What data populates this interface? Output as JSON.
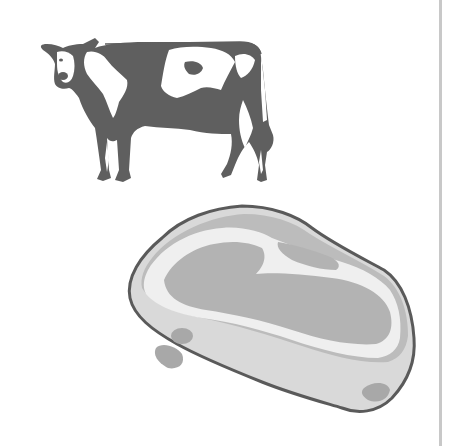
{
  "illustration": {
    "subjects": [
      {
        "name": "cow",
        "description": "Holstein cow standing, facing left, black-and-white patched"
      },
      {
        "name": "steak",
        "description": "Raw steak cut with fat marbling"
      }
    ],
    "colors": {
      "background": "#ffffff",
      "cow_dark": "#5f5f5f",
      "cow_light": "#ffffff",
      "steak_outline": "#5a5a5a",
      "steak_edge": "#d9d9d9",
      "steak_fat": "#efefef",
      "steak_meat": "#b3b3b3",
      "steak_spots": "#a8a8a8",
      "divider": "#c8c8c8"
    }
  }
}
